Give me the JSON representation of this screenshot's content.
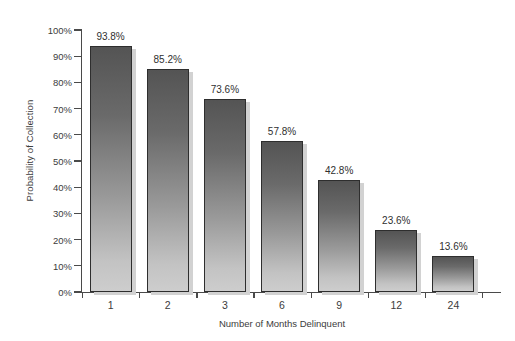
{
  "chart_data": {
    "type": "bar",
    "title": "",
    "xlabel": "Number of Months Delinquent",
    "ylabel": "Probability of Collection",
    "categories": [
      "1",
      "2",
      "3",
      "6",
      "9",
      "12",
      "24"
    ],
    "values": [
      93.8,
      85.2,
      73.6,
      57.8,
      42.8,
      23.6,
      13.6
    ],
    "data_labels": [
      "93.8%",
      "85.2%",
      "73.6%",
      "57.8%",
      "42.8%",
      "23.6%",
      "13.6%"
    ],
    "ylim": [
      0,
      100
    ],
    "ytick_labels": [
      "0%",
      "10%",
      "20%",
      "30%",
      "40%",
      "50%",
      "60%",
      "70%",
      "80%",
      "90%",
      "100%"
    ],
    "ytick_values": [
      0,
      10,
      20,
      30,
      40,
      50,
      60,
      70,
      80,
      90,
      100
    ],
    "grid": false,
    "legend": false,
    "legend_position": "none",
    "series": [
      {
        "name": "Probability of Collection",
        "values": [
          93.8,
          85.2,
          73.6,
          57.8,
          42.8,
          23.6,
          13.6
        ]
      }
    ]
  },
  "style": {
    "background": "#ffffff",
    "axis_color": "#4a4a4a",
    "text_color": "#3c3c3c",
    "bar_top_color": "#545454",
    "bar_bottom_color": "#cdcdcd",
    "bar_border_color": "#2e2e2e",
    "bar_shadow_color": "#d2d2d2"
  }
}
